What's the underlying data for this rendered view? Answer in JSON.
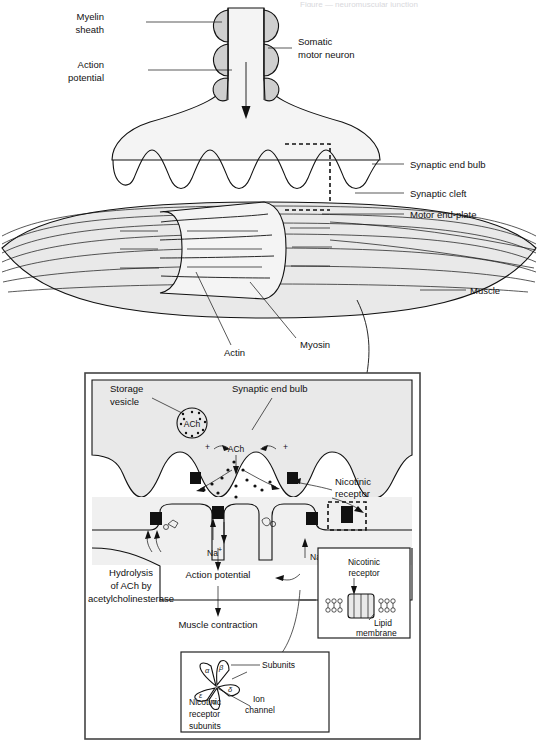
{
  "page": {
    "header_fragment": "Figure — neuromuscular junction",
    "width": 538,
    "height": 753
  },
  "diagram": {
    "title": "Neuromuscular junction",
    "type": "biological-illustration"
  },
  "main_panel": {
    "labels": [
      {
        "id": "myelin-sheath",
        "text_line1": "Myelin",
        "text_line2": "sheath"
      },
      {
        "id": "action-potential",
        "text_line1": "Action",
        "text_line2": "potential"
      },
      {
        "id": "somatic-motor-neuron",
        "text_line1": "Somatic",
        "text_line2": "motor neuron"
      },
      {
        "id": "synaptic-end-bulb",
        "text_line1": "Synaptic end bulb",
        "text_line2": ""
      },
      {
        "id": "synaptic-cleft",
        "text_line1": "Synaptic cleft",
        "text_line2": ""
      },
      {
        "id": "motor-end-plate",
        "text_line1": "Motor end-plate",
        "text_line2": ""
      },
      {
        "id": "muscle",
        "text_line1": "Muscle",
        "text_line2": ""
      },
      {
        "id": "actin",
        "text_line1": "Actin",
        "text_line2": ""
      },
      {
        "id": "myosin",
        "text_line1": "Myosin",
        "text_line2": ""
      }
    ]
  },
  "inset_panel": {
    "labels": {
      "storage_vesicle_l1": "Storage",
      "storage_vesicle_l2": "vesicle",
      "synaptic_end_bulb": "Synaptic end bulb",
      "ach_vesicle": "ACh",
      "ach_cleft": "ACh",
      "plus_left": "+",
      "plus_right": "+",
      "sodium_center": "Na",
      "sodium_right": "Na",
      "sodium_superscript": "+",
      "nicotinic_receptor_l1": "Nicotinic",
      "nicotinic_receptor_l2": "receptor",
      "hydrolysis_l1": "Hydrolysis",
      "hydrolysis_l2": "of ACh by",
      "hydrolysis_l3": "acetylcholinesterase",
      "action_potential": "Action potential",
      "muscle_contraction": "Muscle contraction"
    }
  },
  "membrane_inset": {
    "title_l1": "Nicotinic",
    "title_l2": "receptor",
    "lipid_l1": "Lipid",
    "lipid_l2": "membrane"
  },
  "subunits_inset": {
    "subunits_label": "Subunits",
    "ion_channel_l1": "Ion",
    "ion_channel_l2": "channel",
    "caption_l1": "Nicotinic",
    "caption_l2": "receptor",
    "caption_l3": "subunits",
    "subunit_symbols": [
      "α",
      "β",
      "δ",
      "α",
      "ε"
    ]
  },
  "colors": {
    "ink": "#111111",
    "fill_light": "#f4f4f4",
    "fill_grey": "#e9e9e9",
    "fill_medium": "#cfcfcf",
    "frame": "#444444",
    "background": "#ffffff"
  }
}
